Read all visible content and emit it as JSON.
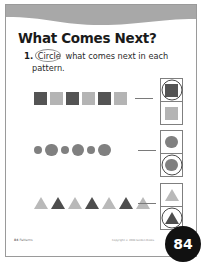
{
  "worksheet": {
    "title": "What Comes Next?",
    "instruction": {
      "number": "1.",
      "circled_word": "Circle",
      "text_after": " what comes next in each",
      "line_2": "pattern."
    }
  },
  "colors": {
    "shape_dark": "#545454",
    "shape_light": "#b4b4b4",
    "circle_gray": "#808080",
    "triangle_dark": "#4e4e4e",
    "triangle_light": "#b9b9b9",
    "banner_gray": "#a8a8a8",
    "page_badge": "#111111",
    "border": "#7f7f7f"
  },
  "patterns": [
    {
      "id": "squares",
      "shape": "square",
      "sequence": [
        "dark",
        "light",
        "dark",
        "light",
        "dark",
        "light"
      ],
      "answer_choices": [
        {
          "fill": "dark",
          "circled": true
        },
        {
          "fill": "light",
          "circled": false
        }
      ]
    },
    {
      "id": "circles",
      "shape": "circle",
      "sequence": [
        "small",
        "big",
        "small",
        "big",
        "small",
        "big"
      ],
      "answer_choices": [
        {
          "size": "small",
          "circled": false
        },
        {
          "size": "big",
          "circled": true
        }
      ]
    },
    {
      "id": "triangles",
      "shape": "triangle",
      "sequence": [
        "light",
        "dark",
        "light",
        "dark",
        "light",
        "dark",
        "light"
      ],
      "answer_choices": [
        {
          "fill": "light",
          "circled": false
        },
        {
          "fill": "dark",
          "circled": true
        }
      ]
    }
  ],
  "footer": {
    "left_page": "84",
    "left_label": "Patterns",
    "copyright": "Copyright © 2004 Golden Books",
    "page_number": "84"
  }
}
